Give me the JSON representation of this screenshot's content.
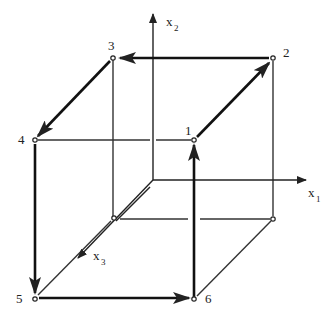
{
  "diagram": {
    "type": "cube-traversal",
    "axes": [
      {
        "id": "x1",
        "label": "x",
        "subscript": "1",
        "direction": "right"
      },
      {
        "id": "x2",
        "label": "x",
        "subscript": "2",
        "direction": "up"
      },
      {
        "id": "x3",
        "label": "x",
        "subscript": "3",
        "direction": "down-left"
      }
    ],
    "vertices": [
      {
        "id": "1",
        "label": "1",
        "position": "front-top-right"
      },
      {
        "id": "2",
        "label": "2",
        "position": "back-top-right"
      },
      {
        "id": "3",
        "label": "3",
        "position": "back-top-left"
      },
      {
        "id": "4",
        "label": "4",
        "position": "front-top-left"
      },
      {
        "id": "5",
        "label": "5",
        "position": "front-bottom-left"
      },
      {
        "id": "6",
        "label": "6",
        "position": "front-bottom-right"
      }
    ],
    "path": [
      "6",
      "1",
      "2",
      "3",
      "4",
      "5",
      "6"
    ],
    "arrows": [
      {
        "from": "6",
        "to": "1"
      },
      {
        "from": "1",
        "to": "2"
      },
      {
        "from": "2",
        "to": "3"
      },
      {
        "from": "3",
        "to": "4"
      },
      {
        "from": "4",
        "to": "5"
      },
      {
        "from": "5",
        "to": "6"
      }
    ],
    "colors": {
      "line": "#222222",
      "background": "#ffffff"
    }
  }
}
